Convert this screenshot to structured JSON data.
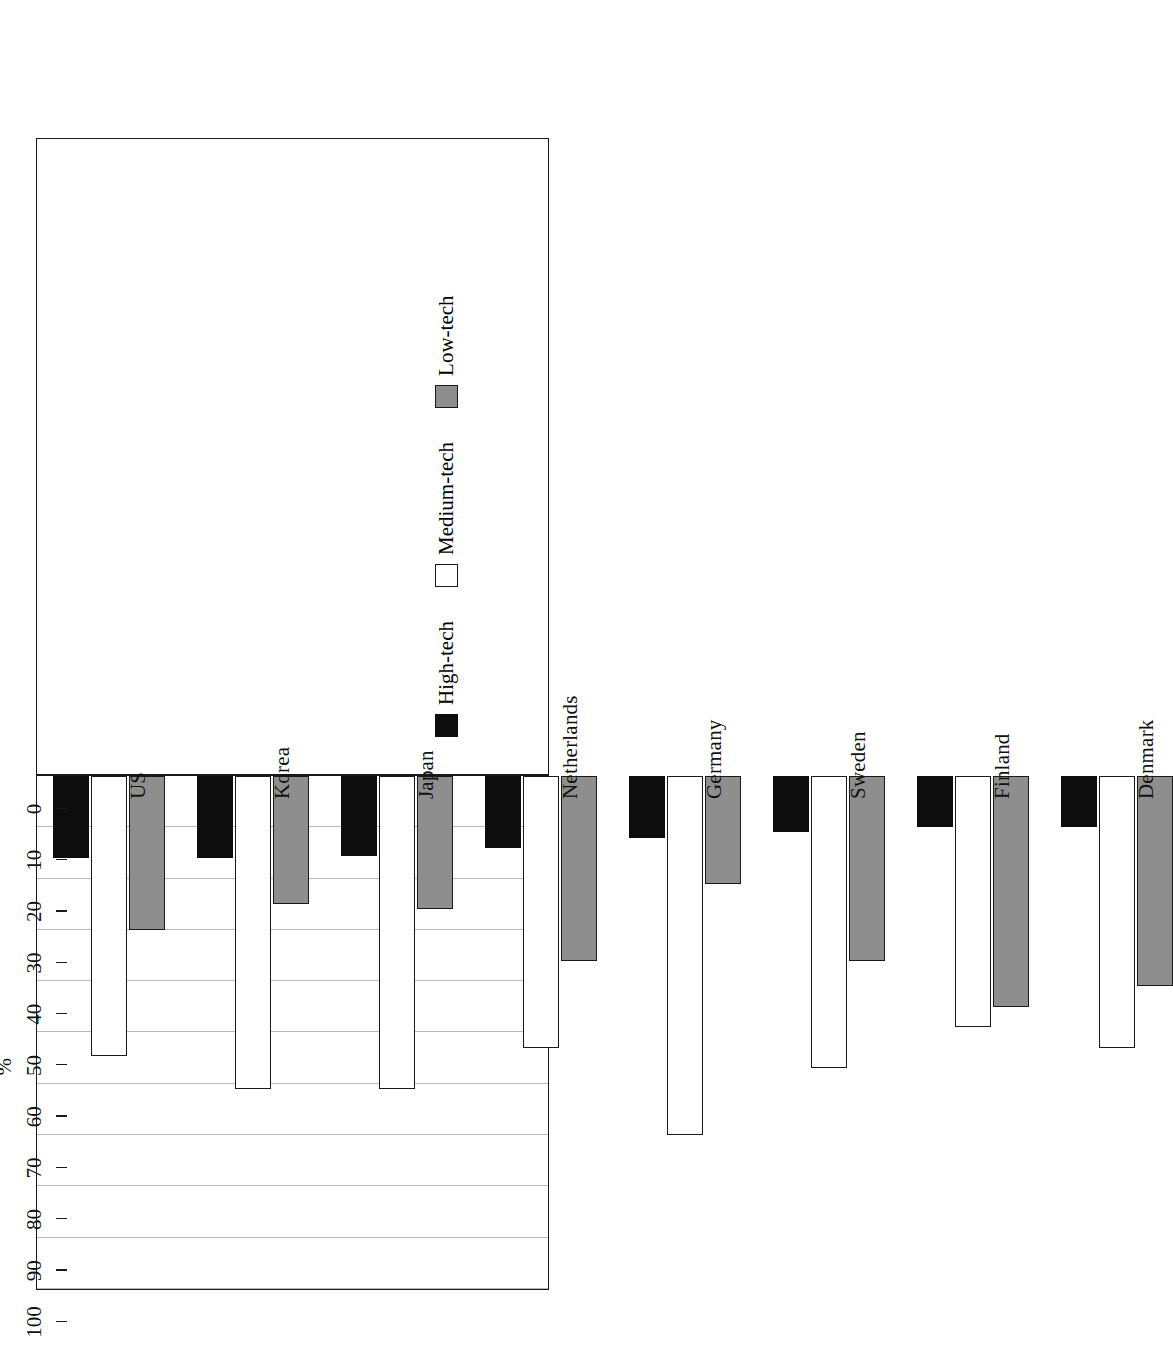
{
  "chart_data": {
    "type": "bar",
    "orientation": "horizontal-rotated",
    "title": "",
    "xlabel": "",
    "ylabel": "%",
    "ylim": [
      0,
      100
    ],
    "grid": true,
    "legend_position": "bottom",
    "categories": [
      "US",
      "Korea",
      "Japan",
      "Netherlands",
      "Germany",
      "Sweden",
      "Finland",
      "Denmark"
    ],
    "tick_labels": [
      "0",
      "10",
      "20",
      "30",
      "40",
      "50",
      "60",
      "70",
      "80",
      "90",
      "100"
    ],
    "tick_values": [
      0,
      10,
      20,
      30,
      40,
      50,
      60,
      70,
      80,
      90,
      100
    ],
    "series": [
      {
        "name": "High-tech",
        "color": "#0d0d0d",
        "values": [
          16,
          16,
          15.5,
          14,
          12,
          11,
          10,
          10
        ]
      },
      {
        "name": "Medium-tech",
        "color": "#ffffff",
        "values": [
          54.5,
          61,
          61,
          53,
          70,
          57,
          49,
          53
        ]
      },
      {
        "name": "Low-tech",
        "color": "#8e8e8e",
        "values": [
          30,
          25,
          26,
          36,
          21,
          36,
          45,
          41
        ]
      }
    ]
  },
  "axis": {
    "value_axis_label": "%",
    "value_axis_min_label": "0",
    "value_axis_max_label": "100"
  },
  "legend": {
    "entries": [
      {
        "label": "High-tech",
        "swatch": "black-square-icon"
      },
      {
        "label": "Medium-tech",
        "swatch": "white-square-icon"
      },
      {
        "label": "Low-tech",
        "swatch": "gray-square-icon"
      }
    ]
  }
}
